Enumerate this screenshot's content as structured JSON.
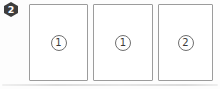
{
  "figure": {
    "badge": {
      "label": "2"
    },
    "cards": [
      {
        "circled_number": "1"
      },
      {
        "circled_number": "1"
      },
      {
        "circled_number": "2"
      }
    ],
    "colors": {
      "badge_bg": "#3d3d3d",
      "badge_text": "#ffffff",
      "card_border": "#9c9c9c",
      "circle_border": "#6f6f6f",
      "number_text": "#3a3a3a",
      "shadow": "#dcdcdc"
    }
  }
}
